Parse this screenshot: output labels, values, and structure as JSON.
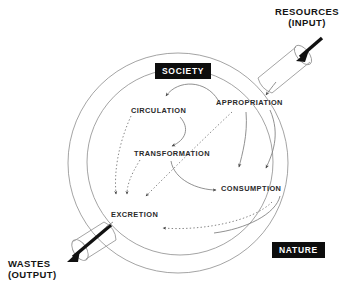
{
  "diagram": {
    "domains": [
      {
        "id": "society",
        "label": "SOCIETY"
      },
      {
        "id": "nature",
        "label": "NATURE"
      }
    ],
    "flows": [
      {
        "id": "input",
        "label_line1": "RESOURCES",
        "label_line2": "(INPUT)"
      },
      {
        "id": "output",
        "label_line1": "WASTES",
        "label_line2": "(OUTPUT)"
      }
    ],
    "processes": [
      {
        "id": "appropriation",
        "label": "APPROPRIATION"
      },
      {
        "id": "circulation",
        "label": "CIRCULATION"
      },
      {
        "id": "transformation",
        "label": "TRANSFORMATION"
      },
      {
        "id": "consumption",
        "label": "CONSUMPTION"
      },
      {
        "id": "excretion",
        "label": "EXCRETION"
      }
    ],
    "colors": {
      "box_fill": "#0d0d0d",
      "box_text": "#ffffff",
      "stroke": "#8d8d8d",
      "arrow_solid": "#5a5a5a",
      "arrow_black": "#111111",
      "background": "#ffffff"
    }
  }
}
